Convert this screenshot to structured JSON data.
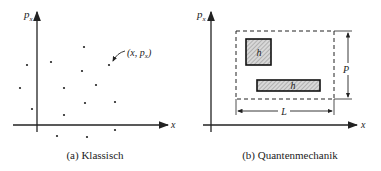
{
  "panels": [
    {
      "caption": "(a) Klassisch",
      "y_axis_label": "p",
      "y_axis_sub": "x",
      "x_axis_label": "x",
      "point_annotation": "(x, p",
      "point_annotation_sub": "x",
      "point_annotation_close": ")",
      "points": [
        [
          84,
          47
        ],
        [
          51,
          62
        ],
        [
          27,
          65
        ],
        [
          82,
          71
        ],
        [
          109,
          65
        ],
        [
          20,
          88
        ],
        [
          64,
          88
        ],
        [
          96,
          85
        ],
        [
          85,
          103
        ],
        [
          115,
          102
        ],
        [
          32,
          109
        ],
        [
          64,
          115
        ],
        [
          57,
          136
        ],
        [
          87,
          137
        ],
        [
          115,
          130
        ]
      ]
    },
    {
      "caption": "(b) Quantenmechanik",
      "y_axis_label": "p",
      "y_axis_sub": "x",
      "x_axis_label": "x",
      "cell_label_1": "h",
      "cell_label_2": "h",
      "height_label": "P",
      "width_label": "L"
    }
  ]
}
